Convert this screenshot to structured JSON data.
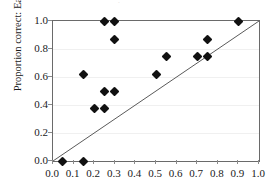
{
  "figure": {
    "title_remnant": "·",
    "background_color": "#ffffff",
    "frame_color": "#6a6a6a",
    "grid_color": "#f0f0f0",
    "marker_color": "#111111",
    "line_color": "#5a5a5a"
  },
  "chart_data": {
    "type": "scatter",
    "title": "",
    "xlabel": "",
    "ylabel": "Proportion correct: Easy",
    "xlim": [
      0.0,
      1.0
    ],
    "ylim": [
      0.0,
      1.0
    ],
    "grid": true,
    "grid_axis": "y",
    "legend": "none",
    "xticks": [
      0.0,
      0.1,
      0.2,
      0.3,
      0.4,
      0.5,
      0.6,
      0.7,
      0.8,
      0.9,
      1.0
    ],
    "xtick_labels": [
      "0.0",
      "0.1",
      "0.2",
      "0.3",
      "0.4",
      "0.5",
      "0.6",
      "0.7",
      "0.8",
      "0.9",
      "1.0"
    ],
    "yticks": [
      0.0,
      0.2,
      0.4,
      0.6,
      0.8,
      1.0
    ],
    "ytick_labels": [
      "0.0",
      "0.2",
      "0.4",
      "0.6",
      "0.8",
      "1.0"
    ],
    "marker": "diamond",
    "points": [
      {
        "x": 0.045,
        "y": 0.0
      },
      {
        "x": 0.15,
        "y": 0.0
      },
      {
        "x": 0.2,
        "y": 0.375
      },
      {
        "x": 0.25,
        "y": 0.375
      },
      {
        "x": 0.25,
        "y": 0.5
      },
      {
        "x": 0.3,
        "y": 0.5
      },
      {
        "x": 0.15,
        "y": 0.62
      },
      {
        "x": 0.25,
        "y": 1.0
      },
      {
        "x": 0.3,
        "y": 1.0
      },
      {
        "x": 0.3,
        "y": 0.87
      },
      {
        "x": 0.5,
        "y": 0.62
      },
      {
        "x": 0.55,
        "y": 0.745
      },
      {
        "x": 0.7,
        "y": 0.745
      },
      {
        "x": 0.75,
        "y": 0.745
      },
      {
        "x": 0.75,
        "y": 0.87
      },
      {
        "x": 0.9,
        "y": 1.0
      }
    ],
    "reference_line": {
      "type": "identity",
      "x0": 0.0,
      "y0": 0.0,
      "x1": 1.0,
      "y1": 1.0
    }
  }
}
